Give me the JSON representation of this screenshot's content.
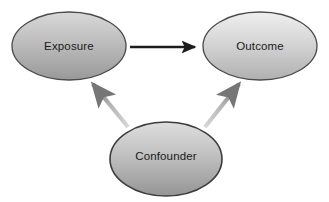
{
  "diagram": {
    "type": "causal-dag",
    "background_color": "#ffffff",
    "nodes": [
      {
        "id": "exposure",
        "label": "Exposure",
        "shape": "ellipse",
        "cx": 69,
        "cy": 46,
        "rx": 57,
        "ry": 34,
        "fill_top": "#d6d6d6",
        "fill_bottom": "#9d9d9d",
        "stroke": "#4a4a4a",
        "text_color": "#1a1a1a"
      },
      {
        "id": "outcome",
        "label": "Outcome",
        "shape": "ellipse",
        "cx": 260,
        "cy": 46,
        "rx": 57,
        "ry": 34,
        "fill_top": "#ebebeb",
        "fill_bottom": "#b4b4b4",
        "stroke": "#4a4a4a",
        "text_color": "#1a1a1a"
      },
      {
        "id": "confounder",
        "label": "Confounder",
        "shape": "ellipse",
        "cx": 166,
        "cy": 159,
        "rx": 56,
        "ry": 37,
        "fill_top": "#dcdcdc",
        "fill_bottom": "#9a9a9a",
        "stroke": "#3c3c3c",
        "text_color": "#1a1a1a"
      }
    ],
    "edges": [
      {
        "id": "exposure-to-outcome",
        "from": "exposure",
        "to": "outcome",
        "label": "",
        "style": "solid",
        "color": "#1c1c1c",
        "x1": 130,
        "y1": 47,
        "x2": 197,
        "y2": 47
      },
      {
        "id": "confounder-to-exposure",
        "from": "confounder",
        "to": "exposure",
        "label": "",
        "style": "solid",
        "color": "#a0a0a0",
        "x1": 128,
        "y1": 127,
        "x2": 92,
        "y2": 83
      },
      {
        "id": "confounder-to-outcome",
        "from": "confounder",
        "to": "outcome",
        "label": "",
        "style": "solid",
        "color": "#a0a0a0",
        "x1": 206,
        "y1": 127,
        "x2": 240,
        "y2": 83
      }
    ]
  }
}
